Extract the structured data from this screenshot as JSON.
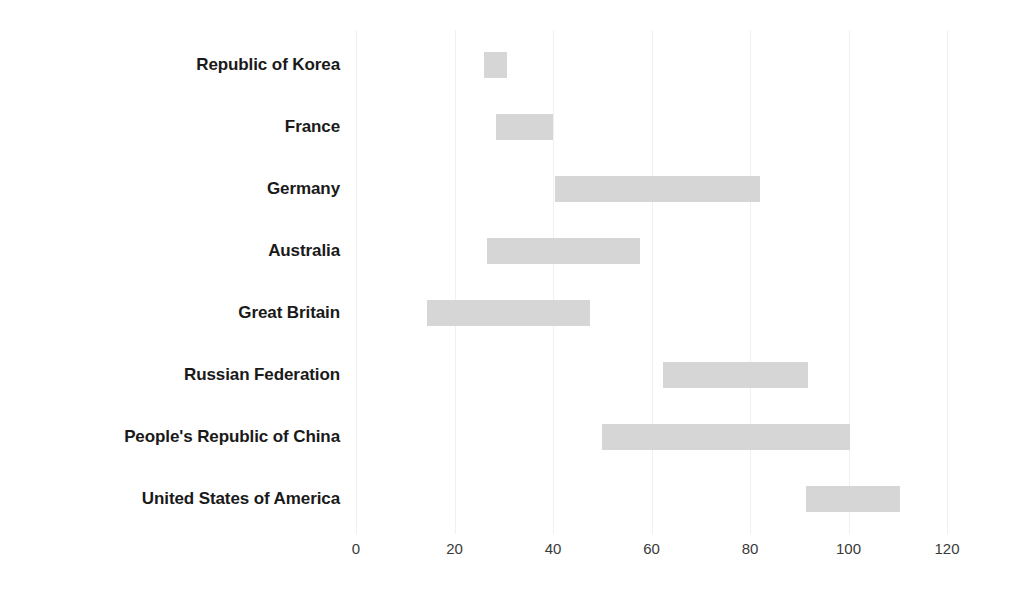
{
  "chart_data": {
    "type": "bar",
    "orientation": "horizontal",
    "variant": "range-bar",
    "title": "",
    "subtitle": "",
    "xlabel": "",
    "ylabel": "",
    "xlim": [
      0,
      120
    ],
    "ylim": null,
    "grid": true,
    "grid_axis": "x",
    "legend": null,
    "legend_position": "none",
    "bar_color": "#d6d6d6",
    "background_color": "#ffffff",
    "label_color": "#1a1a1a",
    "tick_color": "#3a3a3a",
    "gridline_color": "#f0f0f0",
    "categories": [
      "Republic of Korea",
      "France",
      "Germany",
      "Australia",
      "Great Britain",
      "Russian Federation",
      "People's Republic of China",
      "United States of America"
    ],
    "x_ticks": [
      0,
      20,
      40,
      60,
      80,
      100,
      120
    ],
    "x_tick_labels": [
      "0",
      "20",
      "40",
      "60",
      "80",
      "100",
      "120"
    ],
    "bars": [
      {
        "category": "Republic of Korea",
        "start": 26,
        "end": 30.6,
        "length": 4.6
      },
      {
        "category": "France",
        "start": 28.4,
        "end": 40.0,
        "length": 11.6
      },
      {
        "category": "Germany",
        "start": 40.4,
        "end": 82.0,
        "length": 41.6
      },
      {
        "category": "Australia",
        "start": 26.6,
        "end": 57.7,
        "length": 31.1
      },
      {
        "category": "Great Britain",
        "start": 14.4,
        "end": 47.5,
        "length": 33.1
      },
      {
        "category": "Russian Federation",
        "start": 62.3,
        "end": 91.8,
        "length": 29.5
      },
      {
        "category": "People's Republic of China",
        "start": 50.0,
        "end": 100.3,
        "length": 50.3
      },
      {
        "category": "United States of America",
        "start": 91.4,
        "end": 110.5,
        "length": 19.1
      }
    ],
    "series": [
      {
        "name": "start",
        "values": [
          26,
          28.4,
          40.4,
          26.6,
          14.4,
          62.3,
          50.0,
          91.4
        ]
      },
      {
        "name": "end",
        "values": [
          30.6,
          40.0,
          82.0,
          57.7,
          47.5,
          91.8,
          100.3,
          110.5
        ]
      }
    ]
  }
}
